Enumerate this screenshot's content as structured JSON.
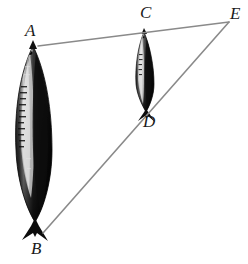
{
  "figure": {
    "kind": "geometry-diagram",
    "subtitle": "Two vertical fish forming similar triangles sharing vertex E",
    "background_color": "#ffffff",
    "line_color": "#8a8a8a",
    "label_color": "#1a1a1a",
    "fish_dark_color": "#141414",
    "fish_highlight_color": "#e8e8e8",
    "labels": [
      {
        "id": "A",
        "text": "A",
        "role": "head-of-large-fish",
        "x": 25,
        "y": 22
      },
      {
        "id": "B",
        "text": "B",
        "role": "tail-of-large-fish",
        "x": 31,
        "y": 240
      },
      {
        "id": "C",
        "text": "C",
        "role": "head-of-small-fish",
        "x": 140,
        "y": 4
      },
      {
        "id": "D",
        "text": "D",
        "role": "tail-of-small-fish",
        "x": 143,
        "y": 113
      },
      {
        "id": "E",
        "text": "E",
        "role": "apex-vertex",
        "x": 230,
        "y": 5
      }
    ],
    "segments": [
      {
        "id": "AE",
        "from": "A",
        "to": "E",
        "x1": 38,
        "y1": 46,
        "x2": 229,
        "y2": 22
      },
      {
        "id": "BE",
        "from": "B",
        "to": "E",
        "x1": 43,
        "y1": 233,
        "x2": 229,
        "y2": 22
      }
    ],
    "fish": [
      {
        "id": "large-fish",
        "label_top": "A",
        "label_bottom": "B",
        "head_x": 33,
        "head_y": 46,
        "tail_x": 43,
        "tail_y": 233,
        "width": 36
      },
      {
        "id": "small-fish",
        "label_top": "C",
        "label_bottom": "D",
        "head_x": 144,
        "head_y": 32,
        "tail_x": 147,
        "tail_y": 110,
        "width": 17
      }
    ]
  }
}
